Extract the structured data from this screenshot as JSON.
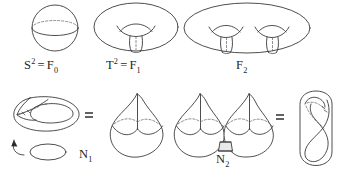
{
  "figure": {
    "background_color": "#ffffff",
    "ink_color": "#3a3a3a",
    "dashed_color": "#6a6a6a",
    "tube_fill_color": "#e9e9e9",
    "width": 348,
    "height": 174
  },
  "top_row": {
    "description": "Orientable closed surfaces of genus 0, 1 and 2",
    "items": [
      {
        "name": "sphere",
        "shape": "sphere",
        "genus": 0,
        "label_base": "S",
        "label_superscript": "2",
        "label_equals": "=",
        "label_family": "F",
        "label_subscript": "0",
        "label_text": "S2 = F0"
      },
      {
        "name": "torus",
        "shape": "torus",
        "genus": 1,
        "label_base": "T",
        "label_superscript": "2",
        "label_equals": "=",
        "label_family": "F",
        "label_subscript": "1",
        "label_text": "T2 = F1"
      },
      {
        "name": "genus-two-surface",
        "shape": "double-torus",
        "genus": 2,
        "label_base": "",
        "label_superscript": "",
        "label_equals": "",
        "label_family": "F",
        "label_subscript": "2",
        "label_text": "F2"
      }
    ]
  },
  "bottom_row": {
    "description": "Non-orientable closed surfaces built from cross-caps",
    "equals_sign_1": "=",
    "equals_sign_2": "=",
    "items": [
      {
        "name": "projective-plane-immersion",
        "shape": "cross-cap-immersed-disk",
        "has_arrow": true,
        "arrow_target": "boundary-circle"
      },
      {
        "name": "cross-cap-sphere-one",
        "shape": "sphere-with-one-crosscap",
        "label_family": "N",
        "label_subscript": "1",
        "label_text": "N1"
      },
      {
        "name": "cross-cap-sphere-two",
        "shape": "sphere-with-two-crosscaps-joined-by-tube",
        "label_family": "N",
        "label_subscript": "2",
        "label_text": "N2"
      },
      {
        "name": "klein-bottle",
        "shape": "klein-bottle",
        "label_family": "",
        "label_subscript": "",
        "label_text": ""
      }
    ]
  },
  "labels": {
    "sphere_label": {
      "base": "S",
      "sup": "2",
      "eq": "=",
      "fam": "F",
      "sub": "0"
    },
    "torus_label": {
      "base": "T",
      "sup": "2",
      "eq": "=",
      "fam": "F",
      "sub": "1"
    },
    "genus2_label": {
      "fam": "F",
      "sub": "2"
    },
    "n1_label": {
      "fam": "N",
      "sub": "1"
    },
    "n2_label": {
      "fam": "N",
      "sub": "2"
    },
    "equals_left": "=",
    "equals_right": "="
  }
}
